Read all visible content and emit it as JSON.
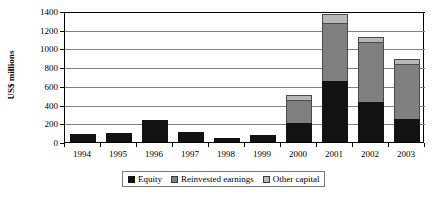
{
  "chart_data": {
    "type": "bar",
    "subtype": "stacked",
    "title": "",
    "xlabel": "",
    "ylabel": "US$ millions",
    "ylim": [
      0,
      1400
    ],
    "ytick_step": 200,
    "yticks": [
      0,
      200,
      400,
      600,
      800,
      1000,
      1200,
      1400
    ],
    "ytick_labels": [
      "0",
      "200",
      "400",
      "600",
      "800",
      "1000",
      "1200",
      "1400"
    ],
    "grid": true,
    "grid_axis": "y",
    "legend_position": "bottom",
    "categories": [
      "1994",
      "1995",
      "1996",
      "1997",
      "1998",
      "1999",
      "2000",
      "2001",
      "2002",
      "2003"
    ],
    "series": [
      {
        "name": "Equity",
        "color": "#121212",
        "values": [
          90,
          100,
          230,
          110,
          40,
          75,
          200,
          650,
          430,
          250
        ]
      },
      {
        "name": "Reinvested earnings",
        "color": "#808080",
        "values": [
          0,
          0,
          0,
          0,
          0,
          0,
          250,
          620,
          640,
          580
        ]
      },
      {
        "name": "Other capital",
        "color": "#b8b8b8",
        "values": [
          0,
          0,
          0,
          0,
          0,
          0,
          50,
          100,
          50,
          60
        ]
      }
    ],
    "totals": [
      90,
      100,
      230,
      110,
      40,
      75,
      500,
      1370,
      1120,
      890
    ]
  },
  "legend": {
    "items": [
      {
        "label": "Equity",
        "swatch": "equity-swatch"
      },
      {
        "label": "Reinvested earnings",
        "swatch": "reinvested-earnings-swatch"
      },
      {
        "label": "Other capital",
        "swatch": "other-capital-swatch"
      }
    ]
  }
}
